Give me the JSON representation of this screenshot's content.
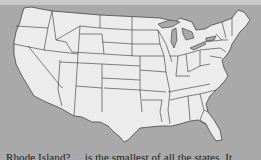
{
  "map": {
    "subject": "United States state outline map (contiguous 48 states)",
    "colors": {
      "background": "#a9a9a9",
      "land": "#ececec",
      "border": "#333333",
      "top_band": "#c9c9c9"
    }
  },
  "caption": {
    "text": "Rhode Island? ... is the smallest of all the states. It"
  }
}
